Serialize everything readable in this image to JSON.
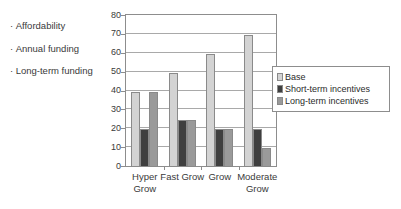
{
  "bullets": [
    {
      "marker": "·",
      "text": "Affordability"
    },
    {
      "marker": "·",
      "text": "Annual funding"
    },
    {
      "marker": "·",
      "text": "Long-term funding"
    }
  ],
  "chart_data": {
    "type": "bar",
    "title": "",
    "xlabel": "",
    "ylabel": "",
    "ylim": [
      0,
      80
    ],
    "yticks": [
      0,
      10,
      20,
      30,
      40,
      50,
      60,
      70,
      80
    ],
    "grid": true,
    "legend_position": "right",
    "categories": [
      "Hyper Grow",
      "Fast Grow",
      "Grow",
      "Moderate Grow"
    ],
    "series": [
      {
        "name": "Base",
        "color": "#d3d3d3",
        "values": [
          40,
          50,
          60,
          70
        ]
      },
      {
        "name": "Short-term incentives",
        "color": "#3f3f3f",
        "values": [
          20,
          25,
          20,
          20
        ]
      },
      {
        "name": "Long-term incentives",
        "color": "#9a9a9a",
        "values": [
          40,
          25,
          20,
          10
        ]
      }
    ]
  }
}
